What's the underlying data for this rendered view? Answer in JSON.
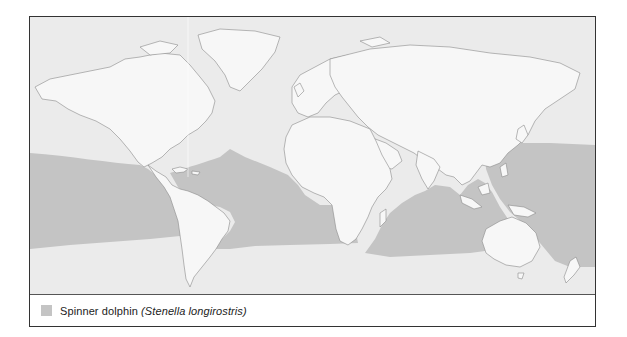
{
  "map": {
    "title": "Spinner dolphin distribution",
    "land_color": "#f7f7f7",
    "ocean_color": "#ebebeb",
    "range_color": "#c4c4c4",
    "coast_color": "#8a8a8a",
    "range_description": "Tropical and subtropical waters worldwide, approx. 30°N to 30-40°S across Pacific, Atlantic and Indian Oceans"
  },
  "legend": {
    "items": [
      {
        "common_name": "Spinner dolphin",
        "scientific_name": "(Stenella longirostris)",
        "color": "#c4c4c4"
      }
    ]
  }
}
